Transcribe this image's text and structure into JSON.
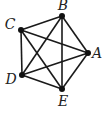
{
  "diagram": {
    "type": "complete-graph",
    "name": "K5",
    "colors": {
      "edge": "#1a1a1a",
      "node": "#111111",
      "label": "#222222",
      "background": "#ffffff"
    },
    "nodes": [
      {
        "id": "A",
        "label": "A",
        "x": 88,
        "y": 53,
        "lx": 97,
        "ly": 58
      },
      {
        "id": "B",
        "label": "B",
        "x": 62,
        "y": 16,
        "lx": 63,
        "ly": 10
      },
      {
        "id": "C",
        "label": "C",
        "x": 21,
        "y": 30,
        "lx": 10,
        "ly": 29
      },
      {
        "id": "D",
        "label": "D",
        "x": 22,
        "y": 75,
        "lx": 11,
        "ly": 84
      },
      {
        "id": "E",
        "label": "E",
        "x": 62,
        "y": 89,
        "lx": 63,
        "ly": 106
      }
    ],
    "edges": [
      [
        "A",
        "B"
      ],
      [
        "A",
        "C"
      ],
      [
        "A",
        "D"
      ],
      [
        "A",
        "E"
      ],
      [
        "B",
        "C"
      ],
      [
        "B",
        "D"
      ],
      [
        "B",
        "E"
      ],
      [
        "C",
        "D"
      ],
      [
        "C",
        "E"
      ],
      [
        "D",
        "E"
      ]
    ]
  }
}
